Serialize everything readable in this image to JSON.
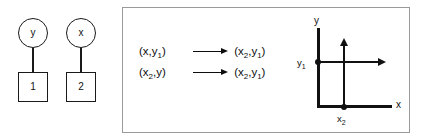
{
  "left_graph": {
    "nodes": [
      {
        "id": "unit-a",
        "circle_label": "y",
        "square_label": "1"
      },
      {
        "id": "unit-b",
        "circle_label": "x",
        "square_label": "2"
      }
    ]
  },
  "panel": {
    "rules": [
      {
        "source_prefix": "(x,y",
        "source_sub": "1",
        "source_suffix": ")",
        "arrow": "right-arrow-icon",
        "target_prefix": "(x",
        "target_sub1": "2",
        "target_mid": ",y",
        "target_sub2": "1",
        "target_suffix": ")"
      },
      {
        "source_prefix": "(x",
        "source_sub": "2",
        "source_mid": ",y",
        "source_suffix": ")",
        "arrow": "right-arrow-icon",
        "target_prefix": "(x",
        "target_sub1": "2",
        "target_mid": ",y",
        "target_sub2": "1",
        "target_suffix": ")"
      }
    ],
    "plot": {
      "y_axis_label": "y",
      "x_axis_label": "x",
      "y_tick_prefix": "y",
      "y_tick_sub": "1",
      "x_tick_prefix": "x",
      "x_tick_sub": "2"
    }
  },
  "colors": {
    "ink": "#111111",
    "panel_border": "#9a9a9a",
    "background": "#ffffff"
  }
}
